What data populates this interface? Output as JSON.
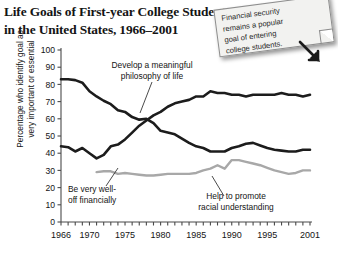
{
  "title": {
    "line1": "Life Goals of First-year College Students",
    "line2": "in the United States, 1966–2001"
  },
  "note": {
    "line1": "Financial security",
    "line2": "remains a popular",
    "line3": "goal of entering",
    "line4": "college students."
  },
  "yaxis_label": {
    "line1": "Percentage who identify goal as",
    "line2": "very important or essential"
  },
  "annotations": {
    "philosophy": {
      "line1": "Develop a meaningful",
      "line2": "philosophy of life"
    },
    "financial": {
      "line1": "Be very well-",
      "line2": "off financially"
    },
    "racial": {
      "line1": "Help to promote",
      "line2": "racial understanding"
    }
  },
  "colors": {
    "dark_line": "#1c1c1c",
    "gray_line": "#a8a8a8",
    "axis": "#4a4a4a",
    "note_bg": "#f2f2f0",
    "background": "#ffffff"
  },
  "chart_data": {
    "type": "line",
    "title": "Life Goals of First-year College Students in the United States, 1966–2001",
    "xlabel": "",
    "ylabel": "Percentage who identify goal as very important or essential",
    "xlim": [
      1966,
      2001
    ],
    "ylim": [
      0,
      100
    ],
    "ytick_labels": [
      "0",
      "10",
      "20",
      "30",
      "40",
      "50",
      "60",
      "70",
      "80",
      "90",
      "100"
    ],
    "yticks": [
      0,
      10,
      20,
      30,
      40,
      50,
      60,
      70,
      80,
      90,
      100
    ],
    "xtick_labels": [
      "1966",
      "1970",
      "1975",
      "1980",
      "1985",
      "1990",
      "1995",
      "2001"
    ],
    "xticks": [
      1966,
      1970,
      1975,
      1980,
      1985,
      1990,
      1995,
      2001
    ],
    "grid": false,
    "legend": "annotations-inline",
    "series": [
      {
        "name": "Develop a meaningful philosophy of life",
        "color": "#1c1c1c",
        "x": [
          1966,
          1967,
          1968,
          1969,
          1970,
          1971,
          1972,
          1973,
          1974,
          1975,
          1976,
          1977,
          1978,
          1979,
          1980,
          1981,
          1982,
          1983,
          1984,
          1985,
          1986,
          1987,
          1988,
          1989,
          1990,
          1991,
          1992,
          1993,
          1994,
          1995,
          1996,
          1997,
          1998,
          1999,
          2000,
          2001
        ],
        "values": [
          83,
          83,
          82.5,
          81,
          76,
          73,
          70.5,
          68.5,
          65,
          64,
          61,
          59.5,
          60,
          57.5,
          53,
          52,
          51,
          48.5,
          46,
          44,
          43,
          41,
          41,
          41,
          43,
          44,
          45.5,
          46,
          44.5,
          43,
          42,
          41.5,
          41,
          41,
          42,
          42
        ]
      },
      {
        "name": "Be very well-off financially",
        "color": "#1c1c1c",
        "x": [
          1966,
          1967,
          1968,
          1969,
          1970,
          1971,
          1972,
          1973,
          1974,
          1975,
          1976,
          1977,
          1978,
          1979,
          1980,
          1981,
          1982,
          1983,
          1984,
          1985,
          1986,
          1987,
          1988,
          1989,
          1990,
          1991,
          1992,
          1993,
          1994,
          1995,
          1996,
          1997,
          1998,
          1999,
          2000,
          2001
        ],
        "values": [
          44,
          43.5,
          41,
          43,
          40,
          37,
          39,
          44,
          45,
          48,
          52,
          56,
          59,
          62,
          64,
          67,
          69,
          70,
          71,
          73,
          73,
          76,
          75,
          75,
          74,
          74,
          73,
          74,
          74,
          74,
          74,
          75,
          74,
          74,
          73,
          74
        ]
      },
      {
        "name": "Help to promote racial understanding",
        "color": "#a8a8a8",
        "x": [
          1971,
          1972,
          1973,
          1974,
          1975,
          1976,
          1977,
          1978,
          1979,
          1980,
          1981,
          1982,
          1983,
          1984,
          1985,
          1986,
          1987,
          1988,
          1989,
          1990,
          1991,
          1992,
          1993,
          1994,
          1995,
          1996,
          1997,
          1998,
          1999,
          2000,
          2001
        ],
        "values": [
          29,
          29.5,
          29.5,
          28,
          28.5,
          28,
          27.5,
          27,
          27,
          27.5,
          28,
          28,
          28,
          28,
          28.5,
          30,
          31,
          33,
          31,
          36,
          36,
          35,
          34,
          33,
          31.5,
          30,
          29,
          28,
          28.5,
          30,
          30
        ]
      }
    ]
  }
}
